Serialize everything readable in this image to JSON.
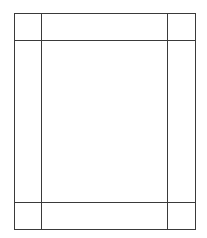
{
  "diagram": {
    "type": "panel-grid",
    "stroke_color": "#3a3a3a",
    "background": "#ffffff",
    "outer": {
      "x1": 14,
      "y1": 13,
      "x2": 195,
      "y2": 229
    },
    "verticals": [
      41,
      168
    ],
    "horizontals": [
      40,
      202
    ],
    "cells": [
      {
        "name": "top-left-corner"
      },
      {
        "name": "top-band"
      },
      {
        "name": "top-right-corner"
      },
      {
        "name": "left-band"
      },
      {
        "name": "center-panel"
      },
      {
        "name": "right-band"
      },
      {
        "name": "bottom-left-corner"
      },
      {
        "name": "bottom-band"
      },
      {
        "name": "bottom-right-corner"
      }
    ]
  }
}
